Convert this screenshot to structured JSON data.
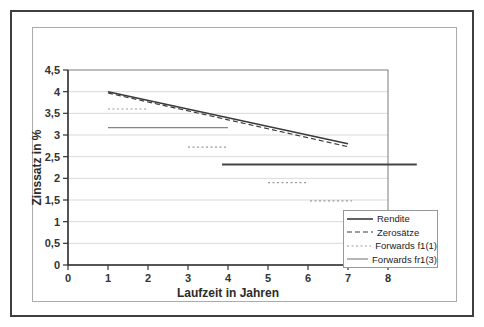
{
  "chart_data": {
    "type": "line",
    "title": "",
    "xlabel": "Laufzeit in Jahren",
    "ylabel": "Zinssatz in %",
    "xlim": [
      0,
      8
    ],
    "ylim": [
      0,
      4.5
    ],
    "grid": "horizontal",
    "gridline_color": "#d9d9d9",
    "axis_color": "#333333",
    "plot_border_color": "#7d7d7d",
    "legend_position": "bottom-right",
    "xticks": {
      "values": [
        0,
        1,
        2,
        3,
        4,
        5,
        6,
        7,
        8
      ],
      "labels": [
        "0",
        "1",
        "2",
        "3",
        "4",
        "5",
        "6",
        "7",
        "8"
      ]
    },
    "yticks": {
      "values": [
        0,
        0.5,
        1,
        1.5,
        2,
        2.5,
        3,
        3.5,
        4,
        4.5
      ],
      "labels": [
        "0",
        "0,5",
        "1",
        "1,5",
        "2",
        "2,5",
        "3",
        "3,5",
        "4",
        "4,5"
      ]
    },
    "series": [
      {
        "name": "Rendite",
        "stroke": "#3a3a3a",
        "width": 1.6,
        "dash": "",
        "segments": [
          [
            [
              1,
              4.0
            ],
            [
              7,
              2.8
            ]
          ]
        ]
      },
      {
        "name": "Zerosätze",
        "stroke": "#3a3a3a",
        "width": 1.2,
        "dash": "5,3",
        "segments": [
          [
            [
              1,
              3.97
            ],
            [
              4,
              3.35
            ],
            [
              7,
              2.73
            ]
          ]
        ]
      },
      {
        "name": "Forwards f1(1)",
        "stroke": "#9a9a9a",
        "width": 1.2,
        "dash": "2,2.5",
        "segments": [
          [
            [
              1,
              3.6
            ],
            [
              2,
              3.6
            ]
          ],
          [
            [
              3,
              2.72
            ],
            [
              4,
              2.72
            ]
          ],
          [
            [
              5,
              1.9
            ],
            [
              6,
              1.9
            ]
          ],
          [
            [
              6.05,
              1.48
            ],
            [
              7.1,
              1.48
            ]
          ]
        ]
      },
      {
        "name": "Forwards fr1(3)",
        "stroke": "#868686",
        "width": 1.2,
        "dash": "",
        "segments": [
          [
            [
              1,
              3.17
            ],
            [
              4,
              3.17
            ]
          ],
          [
            [
              3.85,
              2.32
            ],
            [
              8.72,
              2.32
            ]
          ]
        ],
        "segment_overrides": [
          null,
          {
            "stroke": "#454545",
            "width": 1.8
          }
        ]
      }
    ]
  }
}
